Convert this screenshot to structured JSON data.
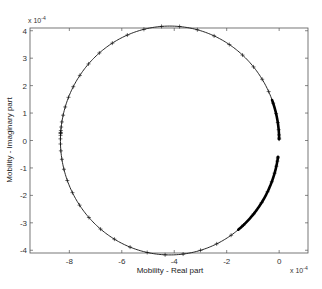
{
  "chart_data": {
    "type": "line",
    "title": "",
    "xlabel": "Mobility - Real part",
    "ylabel": "Mobility - Imaginary part",
    "x_multiplier": "x 10^-4",
    "y_multiplier": "x 10^-4",
    "xlim": [
      -9.5,
      1.1
    ],
    "ylim": [
      -4.1,
      4.1
    ],
    "x_ticks": [
      -8,
      -6,
      -4,
      -2,
      0
    ],
    "y_ticks": [
      -4,
      -3,
      -2,
      -1,
      0,
      1,
      2,
      3,
      4
    ],
    "grid": false,
    "legend": null,
    "series": [
      {
        "name": "Nyquist mobility circle",
        "marker": "+",
        "color": "#000000",
        "center": [
          -4.17,
          0
        ],
        "radius": 4.17,
        "gap_imag_range": [
          -0.6,
          0.05
        ],
        "description": "Circular mobility locus; markers dense near origin (high frequency), sparse on left side",
        "x": [
          -0.02,
          -0.3,
          -1.2,
          -2.5,
          -4.17,
          -5.8,
          -7.1,
          -7.9,
          -8.34,
          -7.9,
          -7.1,
          -5.8,
          -4.17,
          -2.5,
          -1.2,
          -0.3,
          -0.05
        ],
        "y": [
          0.05,
          1.5,
          2.9,
          3.8,
          4.17,
          3.8,
          2.9,
          1.7,
          0.0,
          -1.7,
          -2.9,
          -3.8,
          -4.17,
          -3.8,
          -2.9,
          -1.6,
          -0.6
        ]
      }
    ]
  },
  "labels": {
    "xlabel": "Mobility - Real part",
    "ylabel": "Mobility - Imaginary part",
    "x_exp_base": "x 10",
    "x_exp_pow": "-4",
    "y_exp_base": "x 10",
    "y_exp_pow": "-4"
  }
}
